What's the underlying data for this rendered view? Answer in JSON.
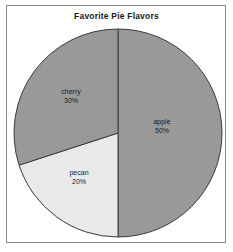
{
  "chart_data": {
    "type": "pie",
    "title": "Favorite Pie Flavors",
    "xlabel": "",
    "ylabel": "",
    "legend": "none",
    "grid": false,
    "start_angle_deg": 0,
    "direction": "clockwise",
    "categories": [
      "apple",
      "pecan",
      "cherry"
    ],
    "values": [
      50,
      20,
      30
    ],
    "units": "percent",
    "slices": [
      {
        "name": "apple",
        "label": "apple",
        "value": 50,
        "percent_label": "50%",
        "color": "#999999",
        "start_deg": 0,
        "end_deg": 180,
        "label_x": 162,
        "label_y": 126
      },
      {
        "name": "pecan",
        "label": "pecan",
        "value": 20,
        "percent_label": "20%",
        "color": "#e9e9e9",
        "start_deg": 180,
        "end_deg": 252,
        "label_x": 79,
        "label_y": 177
      },
      {
        "name": "cherry",
        "label": "cherry",
        "value": 30,
        "percent_label": "30%",
        "color": "#999999",
        "start_deg": 252,
        "end_deg": 360,
        "label_x": 71,
        "label_y": 96
      }
    ],
    "geometry": {
      "center_x": 118,
      "center_y": 133,
      "radius": 104
    },
    "colors": {
      "background": "#ffffff",
      "frame_border": "#8c8c8c",
      "slice_outline": "#3a3a3a",
      "text": "#1a1a1a"
    }
  }
}
